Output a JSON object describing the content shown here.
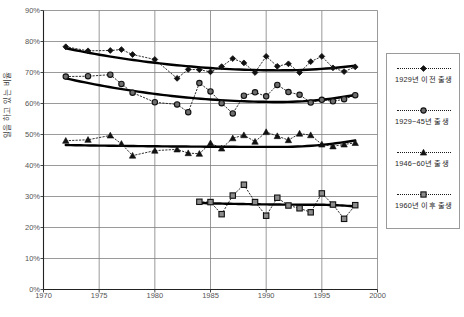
{
  "chart_data": {
    "type": "line",
    "title": "",
    "xlabel": "",
    "ylabel": "일을 하고 있는 비율",
    "xlim": [
      1970,
      2000
    ],
    "ylim": [
      0,
      0.9
    ],
    "grid": true,
    "legend_position": "right",
    "x_tick_labels": [
      "1970",
      "1975",
      "1980",
      "1985",
      "1990",
      "1995",
      "2000"
    ],
    "x_ticks": [
      1970,
      1975,
      1980,
      1985,
      1990,
      1995,
      2000
    ],
    "y_tick_labels": [
      "0%",
      "10%",
      "20%",
      "30%",
      "40%",
      "50%",
      "60%",
      "70%",
      "80%",
      "90%"
    ],
    "y_ticks": [
      0,
      0.1,
      0.2,
      0.3,
      0.4,
      0.5,
      0.6,
      0.7,
      0.8,
      0.9
    ],
    "series": [
      {
        "name": "1929년 이전 출생",
        "marker": "diamond",
        "x": [
          1972,
          1974,
          1976,
          1977,
          1978,
          1980,
          1982,
          1983,
          1984,
          1985,
          1986,
          1987,
          1988,
          1989,
          1990,
          1991,
          1992,
          1993,
          1994,
          1995,
          1996,
          1997,
          1998
        ],
        "values": [
          0.783,
          0.77,
          0.771,
          0.774,
          0.758,
          0.742,
          0.681,
          0.71,
          0.709,
          0.702,
          0.719,
          0.745,
          0.731,
          0.7,
          0.752,
          0.72,
          0.728,
          0.7,
          0.735,
          0.752,
          0.715,
          0.703,
          0.718
        ],
        "trend": {
          "start_value": 0.778,
          "min_value": 0.707,
          "end_value": 0.722,
          "shape": "u-curve"
        }
      },
      {
        "name": "1929~45년 출생",
        "marker": "circle",
        "x": [
          1972,
          1974,
          1976,
          1977,
          1978,
          1980,
          1982,
          1983,
          1984,
          1985,
          1986,
          1987,
          1988,
          1989,
          1990,
          1991,
          1992,
          1993,
          1994,
          1995,
          1996,
          1997,
          1998
        ],
        "values": [
          0.687,
          0.688,
          0.693,
          0.663,
          0.635,
          0.604,
          0.597,
          0.572,
          0.666,
          0.639,
          0.601,
          0.568,
          0.625,
          0.636,
          0.623,
          0.66,
          0.637,
          0.628,
          0.603,
          0.612,
          0.607,
          0.614,
          0.627
        ],
        "trend": {
          "start_value": 0.681,
          "min_value": 0.605,
          "end_value": 0.628,
          "shape": "u-curve"
        }
      },
      {
        "name": "1946~60년 출생",
        "marker": "triangle",
        "x": [
          1972,
          1974,
          1976,
          1977,
          1978,
          1980,
          1982,
          1983,
          1984,
          1985,
          1986,
          1987,
          1988,
          1989,
          1990,
          1991,
          1992,
          1993,
          1994,
          1995,
          1996,
          1997,
          1998
        ],
        "values": [
          0.48,
          0.483,
          0.497,
          0.47,
          0.432,
          0.448,
          0.452,
          0.44,
          0.438,
          0.472,
          0.455,
          0.488,
          0.498,
          0.477,
          0.508,
          0.495,
          0.482,
          0.503,
          0.498,
          0.468,
          0.462,
          0.468,
          0.473
        ],
        "trend": {
          "start_value": 0.466,
          "min_value": 0.46,
          "end_value": 0.481,
          "shape": "flat-u"
        }
      },
      {
        "name": "1960년 이후 출생",
        "marker": "square",
        "x": [
          1984,
          1985,
          1986,
          1987,
          1988,
          1989,
          1990,
          1991,
          1992,
          1993,
          1994,
          1995,
          1996,
          1997,
          1998
        ],
        "values": [
          0.283,
          0.282,
          0.243,
          0.303,
          0.338,
          0.282,
          0.238,
          0.296,
          0.271,
          0.262,
          0.249,
          0.31,
          0.274,
          0.228,
          0.272
        ],
        "trend": {
          "start_value": 0.279,
          "end_value": 0.268,
          "shape": "flat"
        }
      }
    ]
  },
  "legend": {
    "entries": [
      {
        "label": "1929년 이전 출생",
        "marker": "diamond"
      },
      {
        "label": "1929~45년 출생",
        "marker": "circle"
      },
      {
        "label": "1946~60년 출생",
        "marker": "triangle"
      },
      {
        "label": "1960년 이후 출생",
        "marker": "square"
      }
    ]
  }
}
